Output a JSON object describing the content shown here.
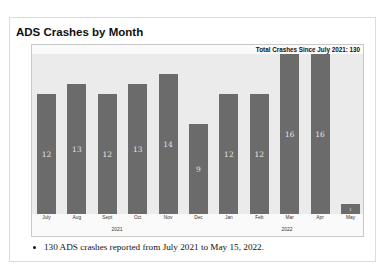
{
  "title": "ADS Crashes by Month",
  "chart_data": {
    "type": "bar",
    "title": "ADS Crashes by Month",
    "annotation": "Total Crashes Since July 2021: 130",
    "categories": [
      "July",
      "Aug",
      "Sept",
      "Oct",
      "Nov",
      "Dec",
      "Jan",
      "Feb",
      "Mar",
      "Apr",
      "May"
    ],
    "values": [
      12,
      13,
      12,
      13,
      14,
      9,
      12,
      12,
      16,
      16,
      1
    ],
    "year_groups": [
      {
        "label": "2021",
        "months": [
          "July",
          "Aug",
          "Sept",
          "Oct",
          "Nov",
          "Dec"
        ]
      },
      {
        "label": "2022",
        "months": [
          "Jan",
          "Feb",
          "Mar",
          "Apr",
          "May"
        ]
      }
    ],
    "xlabel": "",
    "ylabel": "",
    "ylim": [
      0,
      16
    ],
    "grid": false,
    "legend": "none",
    "data_labels": true,
    "bar_color": "#6b6b6b",
    "plot_background": "#ebebeb"
  },
  "bars": [
    {
      "label": "12",
      "month": "July"
    },
    {
      "label": "13",
      "month": "Aug"
    },
    {
      "label": "12",
      "month": "Sept"
    },
    {
      "label": "13",
      "month": "Oct"
    },
    {
      "label": "14",
      "month": "Nov"
    },
    {
      "label": "9",
      "month": "Dec"
    },
    {
      "label": "12",
      "month": "Jan"
    },
    {
      "label": "12",
      "month": "Feb"
    },
    {
      "label": "16",
      "month": "Mar"
    },
    {
      "label": "16",
      "month": "Apr"
    },
    {
      "label": "1",
      "month": "May"
    }
  ],
  "years": [
    "2021",
    "2022"
  ],
  "bullet_text": "130 ADS crashes reported from July 2021 to May 15, 2022."
}
